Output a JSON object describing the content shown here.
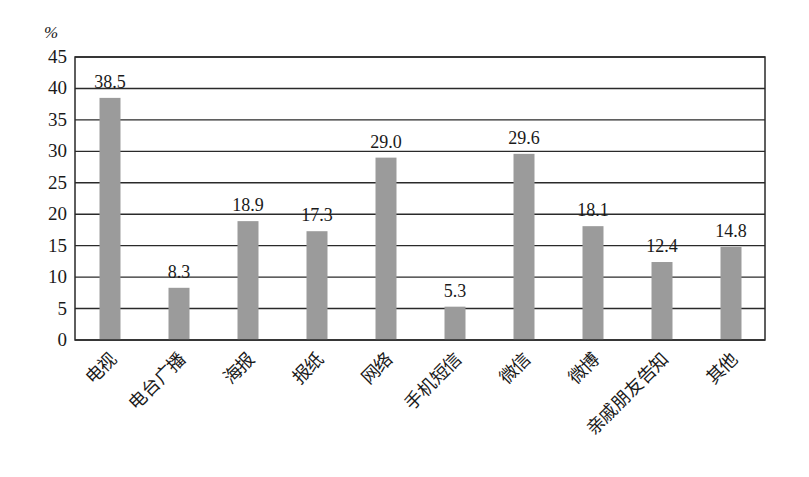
{
  "chart_data": {
    "type": "bar",
    "title": "",
    "xlabel": "",
    "ylabel": "%",
    "unit_label": "%",
    "ylim": [
      0,
      45
    ],
    "yticks": [
      0,
      5,
      10,
      15,
      20,
      25,
      30,
      35,
      40,
      45
    ],
    "grid": true,
    "legend": null,
    "categories": [
      "电视",
      "电台广播",
      "海报",
      "报纸",
      "网络",
      "手机短信",
      "微信",
      "微博",
      "亲戚朋友告知",
      "其他"
    ],
    "values": [
      38.5,
      8.3,
      18.9,
      17.3,
      29.0,
      5.3,
      29.6,
      18.1,
      12.4,
      14.8
    ],
    "value_labels": [
      "38.5",
      "8.3",
      "18.9",
      "17.3",
      "29.0",
      "5.3",
      "29.6",
      "18.1",
      "12.4",
      "14.8"
    ],
    "bar_color": "#9b9b9b",
    "gridline_color": "#2a2a2a"
  }
}
